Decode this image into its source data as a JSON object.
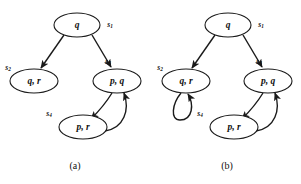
{
  "figure": {
    "panels": [
      {
        "id": "panel-a",
        "caption": "(a)",
        "nodes": [
          {
            "id": "s1",
            "label": "q",
            "state": "s",
            "state_sub": "1",
            "cx": 77,
            "cy": 25,
            "rx": 23,
            "ry": 12,
            "state_x": 110,
            "state_y": 25
          },
          {
            "id": "s2",
            "label": "q, r",
            "state": "s",
            "state_sub": "2",
            "cx": 34,
            "cy": 81,
            "rx": 24,
            "ry": 12,
            "state_x": 8,
            "state_y": 68
          },
          {
            "id": "s3",
            "label": "p, q",
            "state": "s",
            "state_sub": "3",
            "cx": 117,
            "cy": 81,
            "rx": 24,
            "ry": 12,
            "state_x": 108,
            "state_y": 62
          },
          {
            "id": "s4",
            "label": "p, r",
            "state": "s",
            "state_sub": "4",
            "cx": 83,
            "cy": 127,
            "rx": 24,
            "ry": 12,
            "state_x": 49,
            "state_y": 114
          }
        ],
        "edges": [
          {
            "id": "a-s1-s2",
            "from": "s1",
            "to": "s2",
            "kind": "straight",
            "d": "M 64 35 L 41 68"
          },
          {
            "id": "a-s1-s3",
            "from": "s1",
            "to": "s3",
            "kind": "straight",
            "d": "M 92 35 L 111 67"
          },
          {
            "id": "a-s3-s4",
            "from": "s3",
            "to": "s4",
            "kind": "curve",
            "d": "M 112 93 C 104 106 97 113 91 119"
          },
          {
            "id": "a-s4-s3",
            "from": "s4",
            "to": "s3",
            "kind": "curve",
            "d": "M 105 131 C 124 128 130 110 124 93"
          }
        ]
      },
      {
        "id": "panel-b",
        "caption": "(b)",
        "nodes": [
          {
            "id": "s1",
            "label": "q",
            "state": "s",
            "state_sub": "1",
            "cx": 228,
            "cy": 25,
            "rx": 23,
            "ry": 12,
            "state_x": 261,
            "state_y": 25
          },
          {
            "id": "s2",
            "label": "q, r",
            "state": "s",
            "state_sub": "2",
            "cx": 186,
            "cy": 81,
            "rx": 24,
            "ry": 12,
            "state_x": 160,
            "state_y": 68
          },
          {
            "id": "s3",
            "label": "p, q",
            "state": "s",
            "state_sub": "3",
            "cx": 268,
            "cy": 81,
            "rx": 24,
            "ry": 12,
            "state_x": 259,
            "state_y": 62
          },
          {
            "id": "s4",
            "label": "p, r",
            "state": "s",
            "state_sub": "4",
            "cx": 234,
            "cy": 127,
            "rx": 24,
            "ry": 12,
            "state_x": 200,
            "state_y": 114
          }
        ],
        "edges": [
          {
            "id": "b-s1-s2",
            "from": "s1",
            "to": "s2",
            "kind": "straight",
            "d": "M 215 35 L 192 68"
          },
          {
            "id": "b-s1-s3",
            "from": "s1",
            "to": "s3",
            "kind": "straight",
            "d": "M 243 35 L 262 67"
          },
          {
            "id": "b-s2-s2",
            "from": "s2",
            "to": "s2",
            "kind": "selfloop",
            "d": "M 181 93 C 172 104 170 120 180 120 C 193 120 194 104 188 94"
          },
          {
            "id": "b-s3-s4",
            "from": "s3",
            "to": "s4",
            "kind": "curve",
            "d": "M 263 93 C 255 106 248 113 242 119"
          },
          {
            "id": "b-s4-s3",
            "from": "s4",
            "to": "s3",
            "kind": "curve",
            "d": "M 256 131 C 275 128 281 110 275 93"
          }
        ]
      }
    ],
    "colors": {
      "stroke": "#1a1a1a",
      "background": "#ffffff",
      "text": "#111111"
    }
  }
}
